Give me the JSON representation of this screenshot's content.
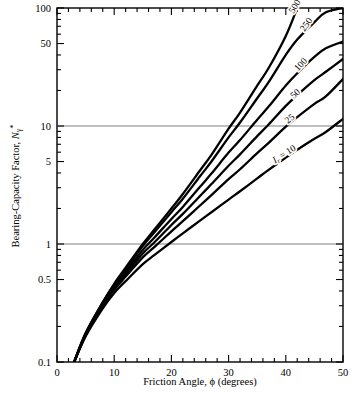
{
  "chart_data": {
    "type": "line",
    "title": "",
    "xlabel": "Friction Angle, ϕ (degrees)",
    "ylabel": "Bearing-Capacity Factor, Nγ*",
    "ylabel_parts": {
      "main": "Bearing-Capacity Factor, ",
      "symbol": "N",
      "subscript": "γ",
      "superscript": "*"
    },
    "xlabel_parts": {
      "prefix": "Friction Angle, ",
      "symbol": "ϕ",
      "suffix": " (degrees)"
    },
    "xscale": "linear",
    "yscale": "log",
    "xlim": [
      0,
      50
    ],
    "ylim": [
      0.1,
      100
    ],
    "xticks": [
      0,
      10,
      20,
      30,
      40,
      50
    ],
    "xtick_labels": [
      "0",
      "10",
      "20",
      "30",
      "40",
      "50"
    ],
    "yticks": [
      0.1,
      0.5,
      1,
      5,
      10,
      50,
      100
    ],
    "ytick_labels": [
      "0.1",
      "0.5",
      "1",
      "5",
      "10",
      "50",
      "100"
    ],
    "grid": "horizontal reference lines at y = 1 and y = 10 only",
    "gridlines": [
      1,
      10
    ],
    "gridline_color": "#808080",
    "curve_color": "#000000",
    "axis_color": "#000000",
    "background_color": "#ffffff",
    "legend": "inline curve labels at right end of each curve",
    "legend_position": "inline-right",
    "series_parameter_name": "I_r",
    "series": [
      {
        "name": "500",
        "label": "500",
        "x": [
          3,
          5,
          8,
          10,
          12,
          15,
          17,
          20,
          22,
          25,
          27,
          30,
          32,
          35,
          37,
          40,
          42
        ],
        "values": [
          0.1,
          0.175,
          0.32,
          0.46,
          0.63,
          1.0,
          1.32,
          2.0,
          2.65,
          4.2,
          5.7,
          9.5,
          13.0,
          22.0,
          31.0,
          58.0,
          100.0
        ]
      },
      {
        "name": "250",
        "label": "250",
        "x": [
          3,
          5,
          8,
          10,
          12,
          15,
          17,
          20,
          22,
          25,
          27,
          30,
          32,
          35,
          37,
          40,
          42,
          45,
          47,
          50
        ],
        "values": [
          0.1,
          0.175,
          0.32,
          0.45,
          0.61,
          0.96,
          1.25,
          1.86,
          2.42,
          3.75,
          5.0,
          8.0,
          10.7,
          17.2,
          23.5,
          40.0,
          54.0,
          76.0,
          92.0,
          100.0
        ]
      },
      {
        "name": "100",
        "label": "100",
        "x": [
          3,
          5,
          8,
          10,
          12,
          15,
          17,
          20,
          22,
          25,
          27,
          30,
          32,
          35,
          37,
          40,
          42,
          45,
          47,
          50
        ],
        "values": [
          0.1,
          0.172,
          0.31,
          0.44,
          0.58,
          0.89,
          1.13,
          1.63,
          2.06,
          3.05,
          3.95,
          5.95,
          7.6,
          11.3,
          14.6,
          22.0,
          28.0,
          38.5,
          45.5,
          52.0
        ]
      },
      {
        "name": "50",
        "label": "50",
        "x": [
          3,
          5,
          8,
          10,
          12,
          15,
          17,
          20,
          22,
          25,
          27,
          30,
          32,
          35,
          37,
          40,
          42,
          45,
          47,
          50
        ],
        "values": [
          0.1,
          0.17,
          0.305,
          0.425,
          0.555,
          0.83,
          1.03,
          1.45,
          1.8,
          2.55,
          3.22,
          4.6,
          5.75,
          8.2,
          10.3,
          14.8,
          18.3,
          24.5,
          28.8,
          37.0
        ]
      },
      {
        "name": "25",
        "label": "25",
        "x": [
          3,
          5,
          8,
          10,
          12,
          15,
          17,
          20,
          22,
          25,
          27,
          30,
          32,
          35,
          37,
          40,
          42,
          45,
          47,
          50
        ],
        "values": [
          0.1,
          0.168,
          0.3,
          0.41,
          0.53,
          0.77,
          0.94,
          1.28,
          1.56,
          2.12,
          2.6,
          3.55,
          4.3,
          5.9,
          7.2,
          9.9,
          11.9,
          15.4,
          17.8,
          25.0
        ]
      },
      {
        "name": "10",
        "label": "Iᵣ = 10",
        "label_parts": {
          "symbol": "I",
          "subscript": "r",
          "rest": " = 10"
        },
        "x": [
          3,
          5,
          8,
          10,
          12,
          15,
          17,
          20,
          22,
          25,
          27,
          30,
          32,
          35,
          37,
          40,
          42,
          45,
          47,
          50
        ],
        "values": [
          0.1,
          0.165,
          0.285,
          0.385,
          0.485,
          0.675,
          0.805,
          1.04,
          1.23,
          1.58,
          1.86,
          2.38,
          2.8,
          3.6,
          4.25,
          5.4,
          6.3,
          7.8,
          8.9,
          11.5
        ]
      }
    ],
    "annotations": [
      {
        "text": "500",
        "near_x": 42,
        "near_y": 100,
        "rotation": -58
      },
      {
        "text": "250",
        "near_x": 44,
        "near_y": 70,
        "rotation": -55
      },
      {
        "text": "100",
        "near_x": 43,
        "near_y": 32,
        "rotation": -47
      },
      {
        "text": "50",
        "near_x": 42,
        "near_y": 18,
        "rotation": -42
      },
      {
        "text": "25",
        "near_x": 41,
        "near_y": 11,
        "rotation": -38
      },
      {
        "text": "Iᵣ = 10",
        "near_x": 40,
        "near_y": 5.5,
        "rotation": -33
      }
    ]
  },
  "figure": {
    "caption": ""
  }
}
